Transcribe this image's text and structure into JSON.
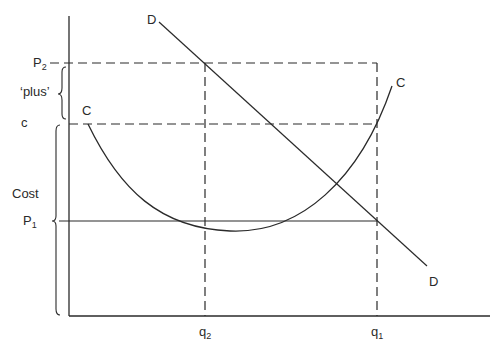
{
  "diagram": {
    "type": "economics-pricing-diagram",
    "background": "#ffffff",
    "line_color": "#2a2a2a",
    "y_axis_labels": {
      "p2": "P",
      "p2_sub": "2",
      "plus": "‘plus’",
      "c": "c",
      "cost": "Cost",
      "p1": "P",
      "p1_sub": "1"
    },
    "x_axis_labels": {
      "q2": "q",
      "q2_sub": "2",
      "q1": "q",
      "q1_sub": "1"
    },
    "curve_labels": {
      "demand_top": "D",
      "demand_bottom": "D",
      "cost_left": "C",
      "cost_right": "C"
    },
    "elements": [
      {
        "name": "demand-line",
        "style": "solid",
        "from": [
          159,
          22
        ],
        "to": [
          427,
          266
        ]
      },
      {
        "name": "cost-curve",
        "style": "solid",
        "shape": "U-curve",
        "start": [
          88,
          124
        ],
        "min": [
          230,
          231
        ],
        "end": [
          392,
          86
        ]
      },
      {
        "name": "p2-guide",
        "style": "dashed",
        "y": 63,
        "x_range": [
          69,
          377
        ]
      },
      {
        "name": "c-guide",
        "style": "dashed",
        "y": 124,
        "x_range": [
          69,
          377
        ]
      },
      {
        "name": "p1-line",
        "style": "solid",
        "y": 221,
        "x_range": [
          59,
          377
        ]
      },
      {
        "name": "q2-guide",
        "style": "dashed",
        "x": 205,
        "y_range": [
          63,
          316
        ]
      },
      {
        "name": "q1-guide",
        "style": "dashed",
        "x": 377,
        "y_range": [
          63,
          316
        ]
      }
    ]
  }
}
